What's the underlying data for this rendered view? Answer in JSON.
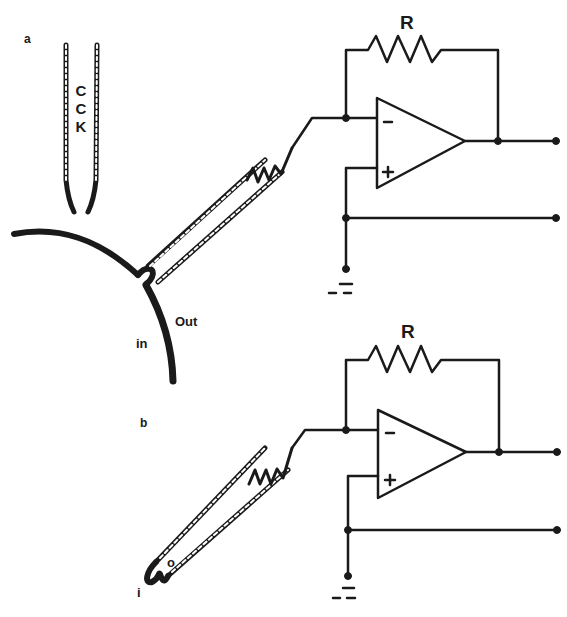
{
  "figure": {
    "panels": [
      {
        "id": "a",
        "label": "a",
        "pipette_label": [
          "C",
          "C",
          "K"
        ],
        "resistor_label": "R",
        "vessel_labels": {
          "in": "in",
          "out": "Out"
        },
        "amp_pins": {
          "inverting": "−",
          "non_inverting": "+"
        }
      },
      {
        "id": "b",
        "label": "b",
        "resistor_label": "R",
        "patch_labels": {
          "inside": "i",
          "outside": "o"
        },
        "amp_pins": {
          "inverting": "−",
          "non_inverting": "+"
        }
      }
    ]
  },
  "colors": {
    "ink": "#1a1a1a",
    "background": "#ffffff"
  }
}
